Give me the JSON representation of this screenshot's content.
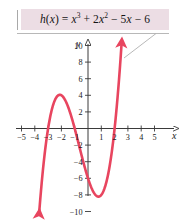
{
  "figure": {
    "name": "cubic-function-graph",
    "width": 184,
    "height": 221,
    "background": "#ffffff"
  },
  "callout": {
    "background": "#ecdde4",
    "rule_color": "#a9a9a9",
    "equation_plain": "h(x) = x³ + 2x² − 5x − 6",
    "equation_parts": {
      "fn": "h",
      "open": "(",
      "var": "x",
      "close": ")",
      "equals": "=",
      "term1_base": "x",
      "term1_exp": "3",
      "plus": "+",
      "term2_coef": "2",
      "term2_base": "x",
      "term2_exp": "2",
      "minus1": "−",
      "term3_coef": "5",
      "term3_var": "x",
      "minus2": "−",
      "term4": "6"
    }
  },
  "leader": {
    "underline_color": "#b0b0b0",
    "diagonal_color": "#b0b0b0"
  },
  "axes": {
    "color": "#3a3a3a",
    "x_letter": "x",
    "y_letter": "y",
    "origin_px": {
      "x": 88,
      "y": 128.5
    },
    "unit_px": {
      "x": 13.3,
      "y": 8.3
    },
    "x_ticks": [
      {
        "value": -5,
        "label": "−5"
      },
      {
        "value": -4,
        "label": "−4"
      },
      {
        "value": -3,
        "label": "−3"
      },
      {
        "value": -2,
        "label": "−2"
      },
      {
        "value": -1,
        "label": "−1"
      },
      {
        "value": 1,
        "label": "1"
      },
      {
        "value": 2,
        "label": "2"
      },
      {
        "value": 3,
        "label": "3"
      },
      {
        "value": 4,
        "label": "4"
      },
      {
        "value": 5,
        "label": "5"
      }
    ],
    "y_ticks": [
      {
        "value": 10,
        "label": "10"
      },
      {
        "value": 8,
        "label": "8"
      },
      {
        "value": 6,
        "label": "6"
      },
      {
        "value": 4,
        "label": "4"
      },
      {
        "value": 2,
        "label": "2"
      },
      {
        "value": -2,
        "label": "−2"
      },
      {
        "value": -4,
        "label": "−4"
      },
      {
        "value": -6,
        "label": "−6"
      },
      {
        "value": -8,
        "label": "−8"
      },
      {
        "value": -10,
        "label": "−10"
      }
    ]
  },
  "chart_data": {
    "type": "line",
    "xlabel": "x",
    "ylabel": "y",
    "xlim": [
      -5.8,
      5.8
    ],
    "ylim": [
      -11.5,
      11.5
    ],
    "grid": false,
    "legend": false,
    "curve_color": "#e8455f",
    "function": "h(x) = x^3 + 2x^2 - 5x - 6",
    "coefficients": {
      "x3": 1,
      "x2": 2,
      "x1": -5,
      "x0": -6
    },
    "roots": [
      -3,
      -1,
      2
    ],
    "y_intercept": -6,
    "local_max": {
      "x": -2.12,
      "y": 4.06
    },
    "local_min": {
      "x": 1.12,
      "y": -8.21
    },
    "arrowheads": [
      "start-down-left",
      "end-up-right"
    ],
    "series": [
      {
        "name": "h(x)",
        "x": [
          -3.6,
          -3.4,
          -3.2,
          -3.0,
          -2.8,
          -2.6,
          -2.4,
          -2.2,
          -2.0,
          -1.8,
          -1.6,
          -1.4,
          -1.2,
          -1.0,
          -0.8,
          -0.6,
          -0.4,
          -0.2,
          0.0,
          0.2,
          0.4,
          0.6,
          0.8,
          1.0,
          1.2,
          1.4,
          1.6,
          1.8,
          2.0,
          2.2,
          2.4,
          2.6,
          2.8
        ],
        "y": [
          -8.74,
          -4.78,
          -1.37,
          0.0,
          1.73,
          2.94,
          3.74,
          4.03,
          4.0,
          3.65,
          3.02,
          2.18,
          1.15,
          0.0,
          -1.23,
          -2.5,
          -3.74,
          -4.93,
          -6.0,
          -6.91,
          -7.62,
          -8.06,
          -8.21,
          -8.0,
          -7.39,
          -6.34,
          -4.78,
          -2.69,
          0.0,
          3.33,
          7.34,
          12.1,
          -0.0
        ]
      }
    ],
    "note": "Cubic polynomial crossing the x-axis at x = -3, -1, and 2; passes through (0, -6)."
  }
}
